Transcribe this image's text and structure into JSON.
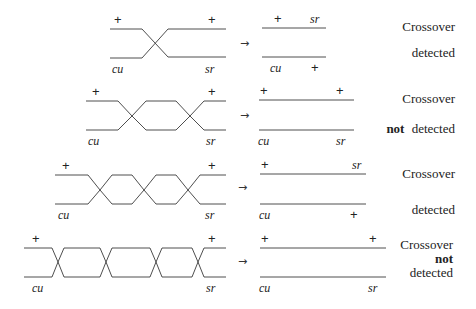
{
  "diagram": {
    "labels": {
      "plus": "+",
      "cu": "cu",
      "sr": "sr",
      "arrow": "→"
    },
    "rows": [
      {
        "crossings": 1,
        "result_top_left": "+",
        "result_top_right": "sr",
        "result_bottom_left": "cu",
        "result_bottom_right": "+",
        "caption_line1": "Crossover",
        "caption_line2_bold": "",
        "caption_line2": "detected"
      },
      {
        "crossings": 2,
        "result_top_left": "+",
        "result_top_right": "+",
        "result_bottom_left": "cu",
        "result_bottom_right": "sr",
        "caption_line1": "Crossover",
        "caption_line2_bold": "not",
        "caption_line2": "detected"
      },
      {
        "crossings": 3,
        "result_top_left": "+",
        "result_top_right": "sr",
        "result_bottom_left": "cu",
        "result_bottom_right": "+",
        "caption_line1": "Crossover",
        "caption_line2_bold": "",
        "caption_line2": "detected"
      },
      {
        "crossings": 4,
        "result_top_left": "+",
        "result_top_right": "+",
        "result_bottom_left": "cu",
        "result_bottom_right": "sr",
        "caption_line1": "Crossover",
        "caption_line2_bold": "not",
        "caption_line3": "detected"
      }
    ]
  }
}
